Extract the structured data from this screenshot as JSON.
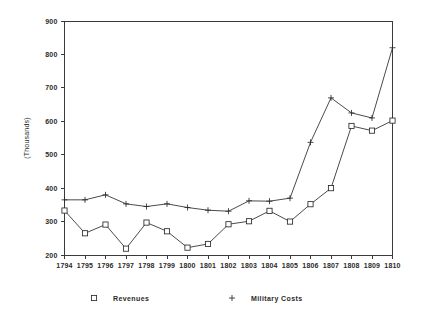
{
  "chart_data": {
    "type": "line",
    "title": "",
    "xlabel": "",
    "ylabel": "(Thousands)",
    "xlim": [
      1794,
      1810
    ],
    "ylim": [
      200,
      900
    ],
    "ytick_step": 100,
    "grid": false,
    "legend_position": "bottom",
    "x": [
      1794,
      1795,
      1796,
      1797,
      1798,
      1799,
      1800,
      1801,
      1802,
      1803,
      1804,
      1805,
      1806,
      1807,
      1808,
      1809,
      1810
    ],
    "xtick_labels": [
      "1794",
      "1795",
      "1796",
      "1797",
      "1798",
      "1799",
      "1800",
      "1801",
      "1802",
      "1803",
      "1804",
      "1805",
      "1806",
      "1807",
      "1808",
      "1809",
      "1810"
    ],
    "ytick_labels": [
      "200",
      "300",
      "400",
      "500",
      "600",
      "700",
      "800",
      "900"
    ],
    "ytick_values": [
      200,
      300,
      400,
      500,
      600,
      700,
      800,
      900
    ],
    "series": [
      {
        "name": "Revenues",
        "marker": "square",
        "values": [
          333,
          265,
          291,
          219,
          297,
          271,
          222,
          233,
          292,
          301,
          332,
          300,
          352,
          400,
          586,
          572,
          602
        ]
      },
      {
        "name": "Military Costs",
        "marker": "plus",
        "values": [
          365,
          365,
          380,
          353,
          345,
          353,
          342,
          334,
          331,
          362,
          361,
          370,
          537,
          670,
          625,
          610,
          820
        ]
      }
    ],
    "legend": [
      {
        "marker": "square",
        "label": "Revenues"
      },
      {
        "marker": "plus",
        "label": "Military Costs"
      }
    ],
    "colors": {
      "line": "#2b2b2b",
      "axis": "#3a3a3a",
      "background": "#ffffff"
    }
  }
}
